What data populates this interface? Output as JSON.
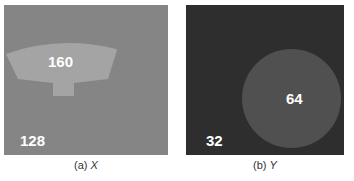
{
  "panels": [
    {
      "id": "X",
      "caption_prefix": "(a)",
      "caption_var": "X",
      "background_color": "#858585",
      "background_value": "128",
      "shape": "trapezoid-lamp",
      "shape_color": "#a4a4a4",
      "shape_value": "160"
    },
    {
      "id": "Y",
      "caption_prefix": "(b)",
      "caption_var": "Y",
      "background_color": "#2e2e2e",
      "background_value": "32",
      "shape": "circle",
      "shape_color": "#505050",
      "shape_value": "64"
    }
  ]
}
